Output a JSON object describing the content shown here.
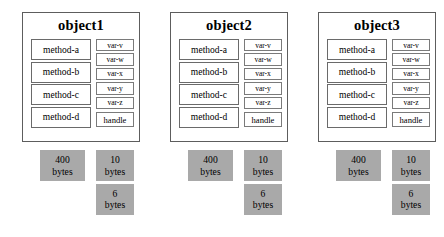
{
  "diagram": {
    "colors": {
      "background": "#ffffff",
      "panel_border": "#5d5d5d",
      "box_border": "#6a6a6a",
      "memory_fill": "#a9a9a9",
      "text": "#000000"
    },
    "objects": [
      {
        "title": "object1",
        "methods": [
          "method-a",
          "method-b",
          "method-c",
          "method-d"
        ],
        "variables": [
          "var-v",
          "var-w",
          "var-x",
          "var-y",
          "var-z"
        ],
        "handle": "handle",
        "memory": [
          {
            "name": "methods-memory",
            "number": "400",
            "unit": "bytes"
          },
          {
            "name": "variables-memory",
            "number": "10",
            "unit": "bytes"
          },
          {
            "name": "handle-memory",
            "number": "6",
            "unit": "bytes"
          }
        ]
      },
      {
        "title": "object2",
        "methods": [
          "method-a",
          "method-b",
          "method-c",
          "method-d"
        ],
        "variables": [
          "var-v",
          "var-w",
          "var-x",
          "var-y",
          "var-z"
        ],
        "handle": "handle",
        "memory": [
          {
            "name": "methods-memory",
            "number": "400",
            "unit": "bytes"
          },
          {
            "name": "variables-memory",
            "number": "10",
            "unit": "bytes"
          },
          {
            "name": "handle-memory",
            "number": "6",
            "unit": "bytes"
          }
        ]
      },
      {
        "title": "object3",
        "methods": [
          "method-a",
          "method-b",
          "method-c",
          "method-d"
        ],
        "variables": [
          "var-v",
          "var-w",
          "var-x",
          "var-y",
          "var-z"
        ],
        "handle": "handle",
        "memory": [
          {
            "name": "methods-memory",
            "number": "400",
            "unit": "bytes"
          },
          {
            "name": "variables-memory",
            "number": "10",
            "unit": "bytes"
          },
          {
            "name": "handle-memory",
            "number": "6",
            "unit": "bytes"
          }
        ]
      }
    ]
  }
}
